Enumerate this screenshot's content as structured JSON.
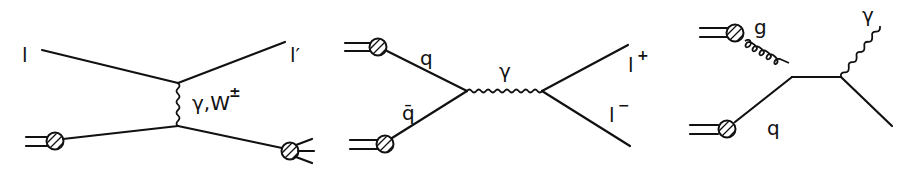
{
  "diagrams": [
    {
      "name": "deep-inelastic-scattering",
      "labels": {
        "incoming_lepton": "l",
        "outgoing_lepton": "l′",
        "exchange": "γ,W",
        "exchange_charge": "±"
      }
    },
    {
      "name": "drell-yan",
      "labels": {
        "quark": "q",
        "antiquark": "q̄",
        "photon": "γ",
        "lepton_plus": "l",
        "plus_sign": "+",
        "lepton_minus": "l",
        "minus_sign": "−"
      }
    },
    {
      "name": "compton-qcd",
      "labels": {
        "gluon": "g",
        "quark": "q",
        "photon": "γ"
      }
    }
  ],
  "colors": {
    "ink": "#111111",
    "background": "#ffffff"
  }
}
